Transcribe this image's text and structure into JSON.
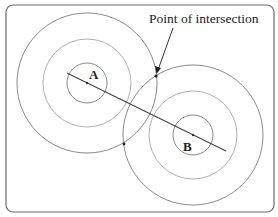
{
  "diagram": {
    "annotation": "Point of intersection",
    "points": [
      {
        "label": "A",
        "cx": 87,
        "cy": 83,
        "label_x": 94,
        "label_y": 78
      },
      {
        "label": "B",
        "cx": 193,
        "cy": 135,
        "label_x": 189,
        "label_y": 151
      }
    ],
    "rings": [
      70,
      44,
      20
    ],
    "intersections": [
      {
        "x": 156,
        "y": 76
      },
      {
        "x": 124,
        "y": 144
      }
    ],
    "colors": {
      "outer_ring": "#8a8a8a",
      "middle_ring": "#b0b0b0",
      "inner_ring": "#8a8a8a",
      "line": "#444444",
      "frame": "#555555"
    }
  }
}
